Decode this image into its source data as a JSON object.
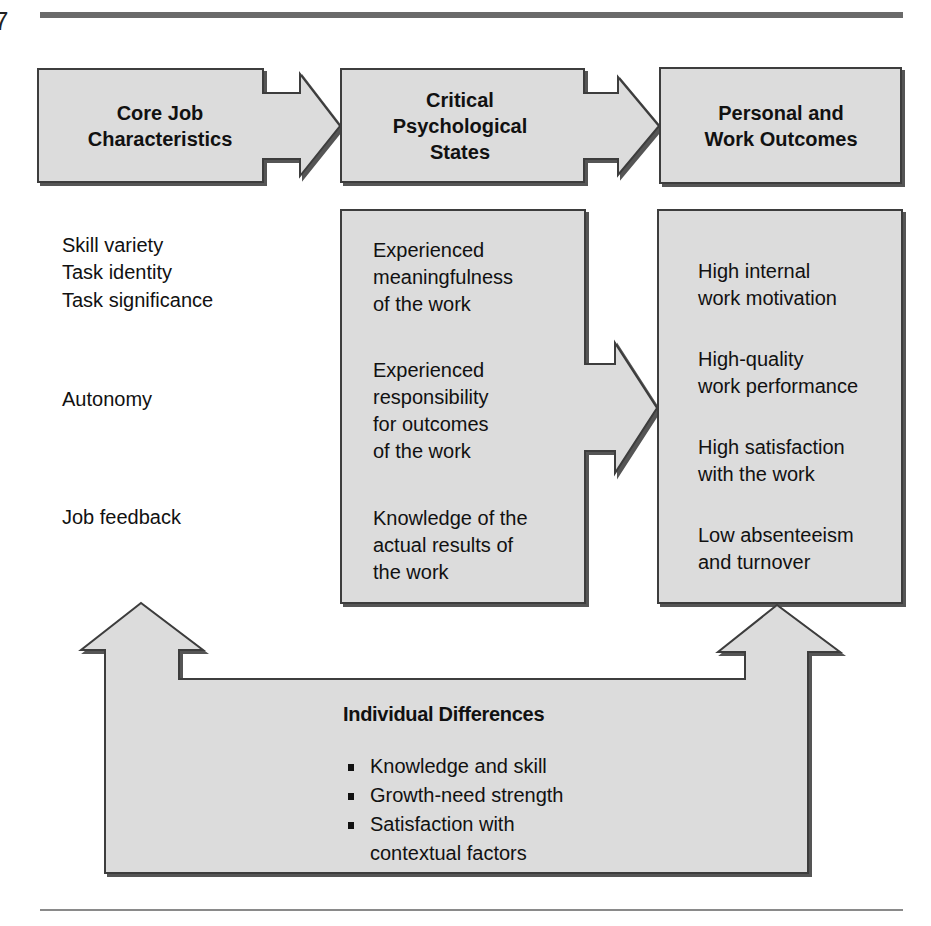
{
  "page": {
    "number": "7"
  },
  "diagram": {
    "title_boxes": [
      {
        "id": "core",
        "label_lines": [
          "Core Job",
          "Characteristics"
        ]
      },
      {
        "id": "critical",
        "label_lines": [
          "Critical",
          "Psychological",
          "States"
        ]
      },
      {
        "id": "outcomes",
        "label_lines": [
          "Personal and",
          "Work Outcomes"
        ]
      }
    ],
    "core_characteristics": [
      "Skill variety",
      "Task identity",
      "Task significance",
      "Autonomy",
      "Job feedback"
    ],
    "psychological_states": [
      [
        "Experienced",
        "meaningfulness",
        "of the work"
      ],
      [
        "Experienced",
        "responsibility",
        "for outcomes",
        "of the work"
      ],
      [
        "Knowledge of the",
        "actual results of",
        "the work"
      ]
    ],
    "outcomes": [
      [
        "High internal",
        "work motivation"
      ],
      [
        "High-quality",
        "work performance"
      ],
      [
        "High satisfaction",
        "with the work"
      ],
      [
        "Low absenteeism",
        "and turnover"
      ]
    ],
    "individual_differences": {
      "title": "Individual Differences",
      "items": [
        [
          "Knowledge and skill"
        ],
        [
          "Growth-need strength"
        ],
        [
          "Satisfaction with",
          "contextual factors"
        ]
      ]
    },
    "colors": {
      "fill": "#dcdcdc",
      "stroke": "#3c3c3c",
      "shadow": "#555555",
      "rule": "#6a6a6a"
    }
  }
}
